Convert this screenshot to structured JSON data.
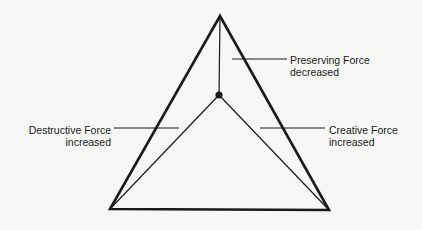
{
  "diagram": {
    "outer_triangle": {
      "apex": [
        220,
        16
      ],
      "bottom_left": [
        110,
        209
      ],
      "bottom_right": [
        329,
        210
      ]
    },
    "center_point": [
      219,
      95
    ],
    "labels": {
      "preserving": {
        "line1": "Preserving Force",
        "line2": "decreased"
      },
      "destructive": {
        "line1": "Destructive Force",
        "line2": "increased"
      },
      "creative": {
        "line1": "Creative Force",
        "line2": "increased"
      }
    },
    "colors": {
      "stroke": "#1a1a1a",
      "background": "#f7f7f5"
    }
  }
}
